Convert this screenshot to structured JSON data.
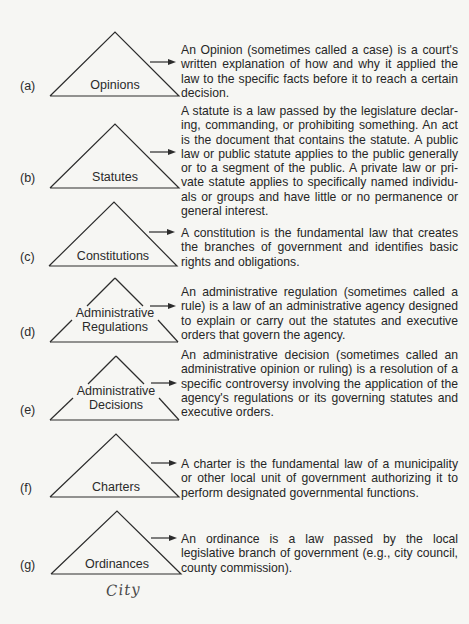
{
  "sources_of_law": [
    {
      "letter": "(a)",
      "name_lines": [
        "Opinions"
      ],
      "description": "An Opinion (sometimes called a case) is a court's written explanation of how and why it applied the law to the specific facts before it to reach a certain decision."
    },
    {
      "letter": "(b)",
      "name_lines": [
        "Statutes"
      ],
      "description": "A statute is a law passed by the legislature declar­ing, commanding, or prohibiting something. An act is the document that contains the statute. A public law or public statute applies to the public generally or to a segment of the public. A private law or pri­vate statute applies to specifically named individu­als or groups and have little or no permanence or general interest."
    },
    {
      "letter": "(c)",
      "name_lines": [
        "Constitutions"
      ],
      "description": "A constitution is the fundamental law that creates the branches of government and identifies basic rights and obligations."
    },
    {
      "letter": "(d)",
      "name_lines": [
        "Administrative",
        "Regulations"
      ],
      "description": "An administrative regulation (sometimes called a rule) is a law of an administrative agency designed to explain or carry out the statutes and executive orders that govern the agency."
    },
    {
      "letter": "(e)",
      "name_lines": [
        "Administrative",
        "Decisions"
      ],
      "description": "An administrative decision (sometimes called an administrative opinion or ruling) is a resolution of a specific controversy involving the application of the agency's regulations or its governing statutes and executive orders."
    },
    {
      "letter": "(f)",
      "name_lines": [
        "Charters"
      ],
      "description": "A charter is the fundamental law of a municipality or other local unit of government authorizing it to per­form designated governmental functions."
    },
    {
      "letter": "(g)",
      "name_lines": [
        "Ordinances"
      ],
      "description": "An ordinance is a law passed by the local legislative branch of government (e.g., city council, county commission)."
    }
  ],
  "handwritten_note": "City",
  "icons": {
    "triangle": "triangle-outline",
    "arrow": "right-arrow"
  },
  "colors": {
    "background": "#f6f6f3",
    "ink": "#262626"
  }
}
